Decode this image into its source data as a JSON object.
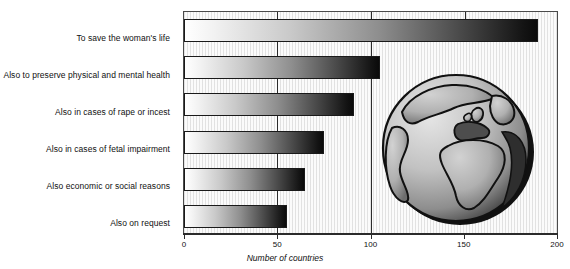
{
  "chart_data": {
    "type": "bar",
    "orientation": "horizontal",
    "title": "",
    "subtitle": "",
    "xlabel": "Number of countries",
    "ylabel": "",
    "categories": [
      "To save the woman's life",
      "Also to preserve physical and mental health",
      "Also in cases of rape or incest",
      "Also in cases of fetal impairment",
      "Also economic or social reasons",
      "Also on request"
    ],
    "values": [
      190,
      105,
      91,
      75,
      65,
      55
    ],
    "xlim": [
      0,
      200
    ],
    "xticks": [
      0,
      50,
      100,
      150,
      200
    ],
    "xtick_labels": [
      "0",
      "50",
      "100",
      "150",
      "200"
    ],
    "grid": "vertical gridlines at 50, 100, 150",
    "legend": "none",
    "bar_style": "horizontal gradient fill, light at left to black at right, thin dark outline"
  },
  "annotations": {
    "globe_graphic": "globe-icon",
    "globe_description": "decorative shaded globe showing Europe and Africa"
  },
  "colors": {
    "plot_background": "#fbfbfb",
    "axis": "#2b2b2b",
    "bar_outline": "#1a1a1a",
    "bar_gradient_start": "#ffffff",
    "bar_gradient_end": "#0a0a0a",
    "globe_ocean_light": "#d8d8d8",
    "globe_ocean_dark": "#6e6e6e",
    "globe_land": "#b4b4b4",
    "text": "#101010"
  }
}
